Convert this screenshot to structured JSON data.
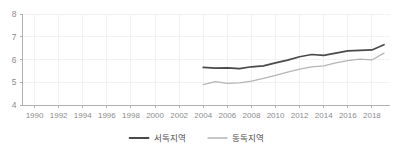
{
  "chart_data": {
    "type": "line",
    "title": "",
    "subtitle": "",
    "xlabel": "",
    "ylabel": "",
    "xlim": [
      1989,
      2019.5
    ],
    "ylim": [
      4,
      8
    ],
    "grid": true,
    "legend_position": "bottom",
    "xticks": [
      "1990",
      "1992",
      "1994",
      "1996",
      "1998",
      "2000",
      "2002",
      "2004",
      "2006",
      "2008",
      "2010",
      "2012",
      "2014",
      "2016",
      "2018"
    ],
    "yticks": [
      "4",
      "5",
      "6",
      "7",
      "8"
    ],
    "x": [
      2004,
      2005,
      2006,
      2007,
      2008,
      2009,
      2010,
      2011,
      2012,
      2013,
      2014,
      2015,
      2016,
      2017,
      2018,
      2019
    ],
    "series": [
      {
        "name": "서독지역",
        "color": "#4a4a4a",
        "values": [
          5.65,
          5.62,
          5.63,
          5.6,
          5.68,
          5.72,
          5.85,
          5.97,
          6.12,
          6.22,
          6.18,
          6.28,
          6.38,
          6.4,
          6.42,
          6.65
        ]
      },
      {
        "name": "동독지역",
        "color": "#b5b5b5",
        "values": [
          4.9,
          5.03,
          4.95,
          4.97,
          5.05,
          5.17,
          5.3,
          5.45,
          5.58,
          5.68,
          5.72,
          5.85,
          5.95,
          6.02,
          5.98,
          6.28
        ]
      }
    ]
  },
  "axis": {
    "y_tick_color": "#8c8c8c",
    "x_tick_color": "#8c8c8c",
    "axis_line_color": "#b0b0b0",
    "grid_color": "#f2f2f2"
  },
  "legend": {
    "items": [
      {
        "label": "서독지역",
        "color": "#4a4a4a"
      },
      {
        "label": "동독지역",
        "color": "#b5b5b5"
      }
    ]
  }
}
